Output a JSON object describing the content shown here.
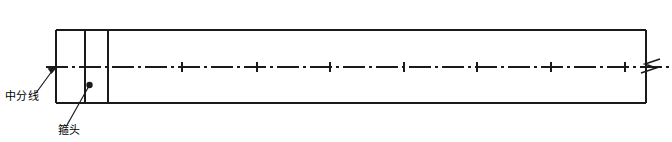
{
  "figure": {
    "kind": "engineering-elevation-drawing",
    "background_color": "#ffffff",
    "line_color": "#1a1a1a",
    "width": 672,
    "height": 142
  },
  "annotations": {
    "center_line": {
      "text": "中分线",
      "leader": {
        "from_x": 37,
        "from_y": 92,
        "to_x": 57,
        "to_y": 67,
        "head": "arrow"
      }
    },
    "hoop_head": {
      "text": "箍头",
      "leader": {
        "from_x": 68,
        "from_y": 124,
        "to_x": 89,
        "to_y": 86,
        "head": "dot"
      }
    }
  },
  "geometry": {
    "outline": {
      "left_x": 56,
      "right_x": 646,
      "top_y": 30,
      "bottom_y": 103
    },
    "center_line_y": 67,
    "center_line_extend_right_x": 669,
    "solid_vertical_lines_x": [
      56,
      85,
      108,
      646
    ],
    "dashed_vertical_lines_x": [
      182,
      257,
      330,
      404,
      477,
      551,
      625
    ],
    "tick_overhang": 7,
    "break_symbol": {
      "x": 652,
      "y": 67,
      "type": "zigzag-break"
    }
  },
  "icons": {
    "break_symbol_name": "break-line-icon",
    "arrow_head_name": "arrow-head-icon",
    "dot_head_name": "leader-dot-icon"
  }
}
